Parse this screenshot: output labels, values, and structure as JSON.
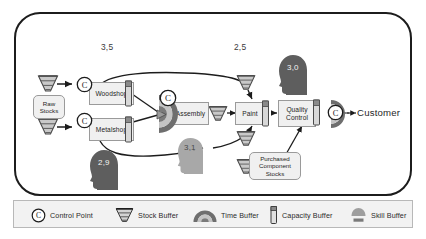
{
  "diagram": {
    "customer_label": "Customer",
    "processes": [
      {
        "id": "woodshop",
        "label": "Woodshop"
      },
      {
        "id": "metalshop",
        "label": "Metalshop"
      },
      {
        "id": "assembly",
        "label": "Assembly"
      },
      {
        "id": "paint",
        "label": "Paint"
      },
      {
        "id": "quality",
        "label": "Quality\nControl"
      }
    ],
    "process_labels": {
      "woodshop": "Woodshop",
      "metalshop": "Metalshop",
      "assembly": "Assembly",
      "paint": "Paint",
      "quality_line1": "Quality",
      "quality_line2": "Control"
    },
    "stores": {
      "raw_line1": "Raw",
      "raw_line2": "Stocks",
      "purchased_line1": "Purchased",
      "purchased_line2": "Component",
      "purchased_line3": "Stocks"
    },
    "values": {
      "woodshop_capacity": "3,5",
      "paint_capacity": "2,5",
      "skill_quality": "3,0",
      "skill_metalshop": "2,9",
      "skill_assembly": "3,1"
    },
    "colors": {
      "frame": "#1c1c1c",
      "box_fill": "#f0f0f0",
      "box_stroke": "#9a9a9a",
      "legend_fill": "#f2f2f2",
      "head_dark": "#5e5e5e",
      "head_light": "#a8a8a8",
      "buffer_gray": "#8a8a8a",
      "edge": "#1c1c1c"
    }
  },
  "legend": {
    "items": [
      {
        "icon": "control-point-icon",
        "label": "Control Point"
      },
      {
        "icon": "stock-buffer-icon",
        "label": "Stock Buffer"
      },
      {
        "icon": "time-buffer-icon",
        "label": "Time Buffer"
      },
      {
        "icon": "capacity-buffer-icon",
        "label": "Capacity Buffer"
      },
      {
        "icon": "skill-buffer-icon",
        "label": "Skill Buffer"
      }
    ]
  }
}
